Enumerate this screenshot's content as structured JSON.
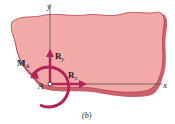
{
  "figure": {
    "caption": "(b)",
    "axes": {
      "x_label": "x",
      "y_label": "y"
    },
    "point_label": "A",
    "forces": [
      {
        "name": "Ry",
        "label_main": "R",
        "label_sub": "y",
        "direction": "up"
      },
      {
        "name": "Rx",
        "label_main": "R",
        "label_sub": "x",
        "direction": "right"
      }
    ],
    "moment": {
      "label_main": "M",
      "label_sub": "A",
      "direction": "counterclockwise"
    },
    "colors": {
      "body_fill": "#f2aaa8",
      "body_edge": "#b5414f",
      "vector": "#b0245c",
      "axis": "#555555"
    }
  }
}
